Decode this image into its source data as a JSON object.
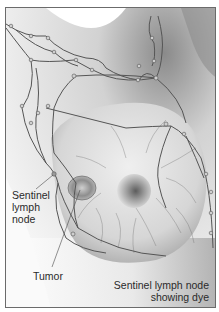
{
  "figure": {
    "style": "grayscale",
    "labels": {
      "sentinel_node": [
        "Sentinel",
        "lymph",
        "node"
      ],
      "tumor": "Tumor",
      "sentinel_dye": [
        "Sentinel lymph node",
        "showing dye"
      ]
    },
    "icons": [
      "lymph-vessel-network",
      "lymph-node",
      "tumor",
      "nipple"
    ]
  }
}
